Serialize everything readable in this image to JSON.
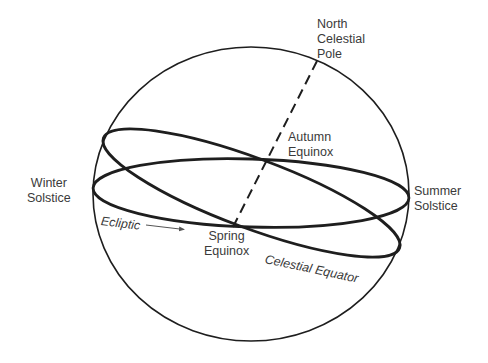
{
  "diagram": {
    "colors": {
      "background": "#ffffff",
      "stroke": "#1e1e1e",
      "text": "#3a3a3a",
      "arrow": "#555555"
    },
    "shapes": {
      "sphere": {
        "cx": 251,
        "cy": 194,
        "rx": 158,
        "ry": 147,
        "stroke_width": 1.6
      },
      "ring_horizontal": {
        "cx": 251,
        "cy": 193,
        "rx": 158,
        "ry": 34,
        "rotate": 1.8,
        "stroke_width": 2.8
      },
      "ring_tilted": {
        "cx": 251.5,
        "cy": 193,
        "rx": 158,
        "ry": 35,
        "rotate": 20.4,
        "stroke_width": 2.8
      },
      "pole_axis": {
        "x1": 317,
        "y1": 61,
        "x2": 233,
        "y2": 227,
        "dash": "10 6",
        "stroke_width": 2
      },
      "ecliptic_arrow": {
        "x1": 146,
        "y1": 225,
        "x2": 184,
        "y2": 229.5
      }
    },
    "labels": {
      "north_pole": {
        "lines": [
          "North",
          "Celestial",
          "Pole"
        ]
      },
      "autumn_equinox": {
        "lines": [
          "Autumn",
          "Equinox"
        ]
      },
      "winter_solstice": {
        "lines": [
          "Winter",
          "Solstice"
        ]
      },
      "summer_solstice": {
        "lines": [
          "Summer",
          "Solstice"
        ]
      },
      "spring_equinox": {
        "lines": [
          "Spring",
          "Equinox"
        ]
      },
      "ecliptic": "Ecliptic",
      "celestial_equator": "Celestial Equator"
    }
  }
}
